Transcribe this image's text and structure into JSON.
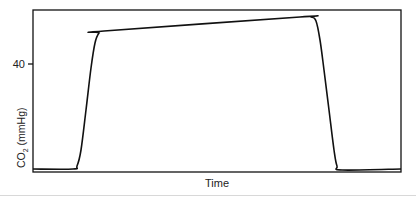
{
  "chart_data": {
    "type": "line",
    "title": "",
    "xlabel": "Time",
    "ylabel": "CO2 (mmHg)",
    "ylabel_main": "CO",
    "ylabel_sub": "2",
    "ylabel_unit": " (mmHg)",
    "y_ticks": [
      {
        "label": "40",
        "value": 40
      }
    ],
    "x_ticks": [],
    "grid": false,
    "legend": null,
    "series": [
      {
        "name": "capnogram",
        "color": "#111111",
        "points_px": [
          [
            33,
            169
          ],
          [
            73,
            169
          ],
          [
            77,
            166
          ],
          [
            81,
            150
          ],
          [
            86,
            110
          ],
          [
            91,
            68
          ],
          [
            95,
            43
          ],
          [
            99,
            33
          ],
          [
            104,
            31
          ],
          [
            300,
            17
          ],
          [
            311,
            17
          ],
          [
            316,
            21
          ],
          [
            320,
            40
          ],
          [
            324,
            70
          ],
          [
            329,
            110
          ],
          [
            334,
            150
          ],
          [
            337,
            166
          ],
          [
            342,
            170
          ],
          [
            401,
            169
          ]
        ]
      }
    ]
  }
}
